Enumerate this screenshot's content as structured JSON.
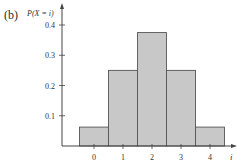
{
  "panel_label": "(b)",
  "chart_data": {
    "type": "bar",
    "title": "",
    "xlabel": "i",
    "ylabel": "P(X = i)",
    "categories": [
      "0",
      "1",
      "2",
      "3",
      "4"
    ],
    "values": [
      0.0625,
      0.25,
      0.375,
      0.25,
      0.0625
    ],
    "yticks": [
      "0.1",
      "0.2",
      "0.3",
      "0.4"
    ],
    "ylim": [
      0,
      0.42
    ],
    "grid": false,
    "legend": null,
    "bar_color": "#c8c8c8",
    "edge_color": "#555555"
  }
}
